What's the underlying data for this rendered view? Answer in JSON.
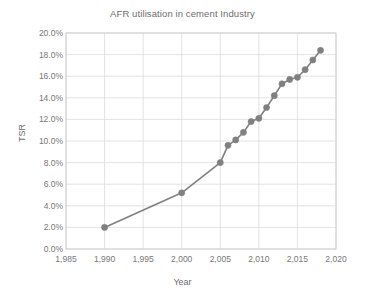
{
  "chart_data": {
    "type": "line",
    "title": "AFR utilisation in cement Industry",
    "xlabel": "Year",
    "ylabel": "TSR",
    "xlim": [
      1985,
      2020
    ],
    "ylim": [
      0,
      20
    ],
    "grid": true,
    "legend": "none",
    "marker": "circle",
    "series_color": "#808080",
    "x": [
      1990,
      2000,
      2005,
      2006,
      2007,
      2008,
      2009,
      2010,
      2011,
      2012,
      2013,
      2014,
      2015,
      2016,
      2017,
      2018
    ],
    "values": [
      2.0,
      5.2,
      8.0,
      9.6,
      10.1,
      10.8,
      11.8,
      12.1,
      13.1,
      14.2,
      15.3,
      15.7,
      15.9,
      16.6,
      17.5,
      18.4
    ],
    "series": [
      {
        "name": "TSR",
        "x": [
          1990,
          2000,
          2005,
          2006,
          2007,
          2008,
          2009,
          2010,
          2011,
          2012,
          2013,
          2014,
          2015,
          2016,
          2017,
          2018
        ],
        "values": [
          2.0,
          5.2,
          8.0,
          9.6,
          10.1,
          10.8,
          11.8,
          12.1,
          13.1,
          14.2,
          15.3,
          15.7,
          15.9,
          16.6,
          17.5,
          18.4
        ]
      }
    ],
    "ytick_labels": [
      "0.0%",
      "2.0%",
      "4.0%",
      "6.0%",
      "8.0%",
      "10.0%",
      "12.0%",
      "14.0%",
      "16.0%",
      "18.0%",
      "20.0%"
    ],
    "ytick_values": [
      0,
      2,
      4,
      6,
      8,
      10,
      12,
      14,
      16,
      18,
      20
    ],
    "xtick_labels": [
      "1,985",
      "1,990",
      "1,995",
      "2,000",
      "2,005",
      "2,010",
      "2,015",
      "2,020"
    ],
    "xtick_values": [
      1985,
      1990,
      1995,
      2000,
      2005,
      2010,
      2015,
      2020
    ]
  },
  "colors": {
    "series": "#808080",
    "gridline": "#dcdcdc",
    "plot_border": "#cfcfcf",
    "text": "#767676",
    "title_text": "#6d6d6d",
    "background": "#ffffff"
  }
}
